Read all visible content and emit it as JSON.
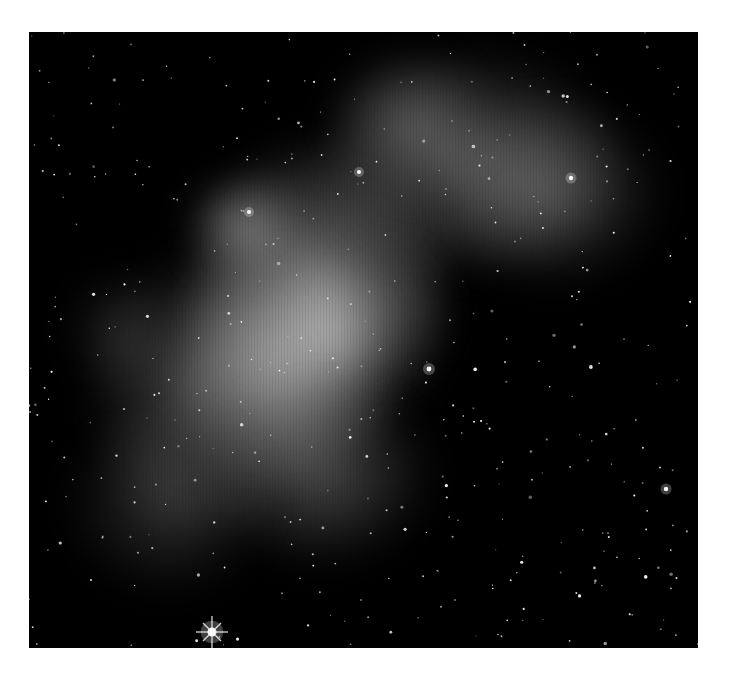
{
  "image": {
    "subject": "emission nebula star field",
    "mode": "grayscale",
    "frame": {
      "x": 29,
      "y": 32,
      "width": 669,
      "height": 616,
      "border_color": "#ffffff",
      "background": "#000000"
    }
  },
  "nebula_blobs": [
    {
      "cx": 290,
      "cy": 260,
      "rx": 130,
      "ry": 150,
      "a": 0.55
    },
    {
      "cx": 250,
      "cy": 330,
      "rx": 110,
      "ry": 120,
      "a": 0.6
    },
    {
      "cx": 300,
      "cy": 300,
      "rx": 50,
      "ry": 60,
      "a": 0.55
    },
    {
      "cx": 215,
      "cy": 195,
      "rx": 55,
      "ry": 50,
      "a": 0.5
    },
    {
      "cx": 440,
      "cy": 130,
      "rx": 150,
      "ry": 110,
      "a": 0.35
    },
    {
      "cx": 520,
      "cy": 160,
      "rx": 110,
      "ry": 90,
      "a": 0.3
    },
    {
      "cx": 380,
      "cy": 90,
      "rx": 80,
      "ry": 70,
      "a": 0.28
    },
    {
      "cx": 170,
      "cy": 360,
      "rx": 110,
      "ry": 140,
      "a": 0.3
    },
    {
      "cx": 290,
      "cy": 440,
      "rx": 110,
      "ry": 90,
      "a": 0.32
    },
    {
      "cx": 140,
      "cy": 470,
      "rx": 100,
      "ry": 90,
      "a": 0.2
    },
    {
      "cx": 360,
      "cy": 280,
      "rx": 60,
      "ry": 70,
      "a": 0.15
    },
    {
      "cx": 90,
      "cy": 300,
      "rx": 50,
      "ry": 60,
      "a": 0.15
    }
  ],
  "bright_stars": [
    {
      "x": 183,
      "y": 600,
      "r": 4.5,
      "spikes": true
    },
    {
      "x": 637,
      "y": 457,
      "r": 2.2,
      "spikes": false
    },
    {
      "x": 400,
      "y": 337,
      "r": 2.4,
      "spikes": false
    },
    {
      "x": 330,
      "y": 140,
      "r": 2,
      "spikes": false
    },
    {
      "x": 542,
      "y": 146,
      "r": 2.2,
      "spikes": false
    },
    {
      "x": 220,
      "y": 180,
      "r": 2,
      "spikes": false
    }
  ]
}
